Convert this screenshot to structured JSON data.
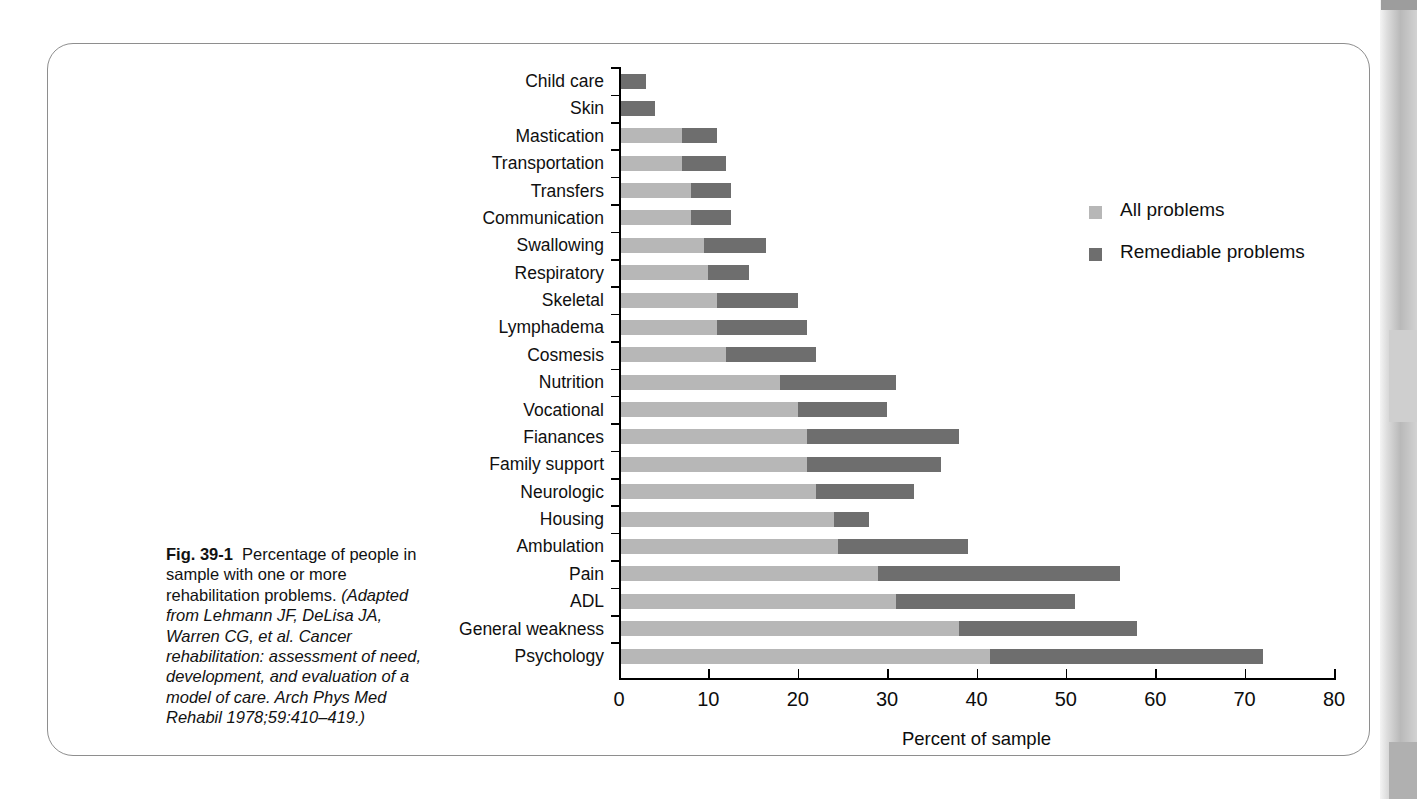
{
  "figure": {
    "number_label": "Fig. 39-1",
    "lead_text": "Percentage of people in sample with one or more rehabilitation problems.",
    "source_text": "(Adapted from Lehmann JF, DeLisa JA, Warren CG, et al. Cancer rehabilitation: assessment of need, development, and evaluation of a model of care. Arch Phys Med Rehabil 1978;59:410–419.)"
  },
  "legend": {
    "position": "top-right",
    "items": [
      {
        "label": "All problems",
        "color": "#b7b7b7",
        "swatch_name": "legend-swatch-all-problems"
      },
      {
        "label": "Remediable problems",
        "color": "#6e6e6e",
        "swatch_name": "legend-swatch-remediable-problems"
      }
    ]
  },
  "chart_data": {
    "type": "bar",
    "orientation": "horizontal",
    "stacked": true,
    "title": "",
    "subtitle": "",
    "xlabel": "Percent of sample",
    "ylabel": "",
    "xlim": [
      0,
      80
    ],
    "xticks": [
      0,
      10,
      20,
      30,
      40,
      50,
      60,
      70,
      80
    ],
    "xtick_labels": [
      "0",
      "10",
      "20",
      "30",
      "40",
      "50",
      "60",
      "70",
      "80"
    ],
    "grid": false,
    "legend_position": "top-right",
    "categories": [
      "Child care",
      "Skin",
      "Mastication",
      "Transportation",
      "Transfers",
      "Communication",
      "Swallowing",
      "Respiratory",
      "Skeletal",
      "Lymphadema",
      "Cosmesis",
      "Nutrition",
      "Vocational",
      "Fianances",
      "Family support",
      "Neurologic",
      "Housing",
      "Ambulation",
      "Pain",
      "ADL",
      "General weakness",
      "Psychology"
    ],
    "series": [
      {
        "name": "All problems",
        "color": "#b7b7b7",
        "note": "light segment: value from 0 up to the split point",
        "values": [
          0,
          0,
          7.0,
          7.0,
          8.0,
          8.0,
          9.5,
          10.0,
          11.0,
          11.0,
          12.0,
          18.0,
          20.0,
          21.0,
          21.0,
          22.0,
          24.0,
          24.5,
          29.0,
          31.0,
          38.0,
          41.5
        ]
      },
      {
        "name": "Remediable problems",
        "color": "#6e6e6e",
        "note": "dark segment: stacked on top of the light segment",
        "values": [
          3.0,
          4.0,
          4.0,
          5.0,
          4.5,
          4.5,
          7.0,
          4.5,
          9.0,
          10.0,
          10.0,
          13.0,
          10.0,
          17.0,
          15.0,
          11.0,
          4.0,
          14.5,
          27.0,
          20.0,
          20.0,
          30.5
        ]
      }
    ],
    "totals": [
      3.0,
      4.0,
      11.0,
      12.0,
      12.5,
      12.5,
      16.5,
      14.5,
      20.0,
      21.0,
      22.0,
      31.0,
      30.0,
      38.0,
      36.0,
      33.0,
      28.0,
      39.0,
      56.0,
      51.0,
      58.0,
      72.0
    ]
  }
}
